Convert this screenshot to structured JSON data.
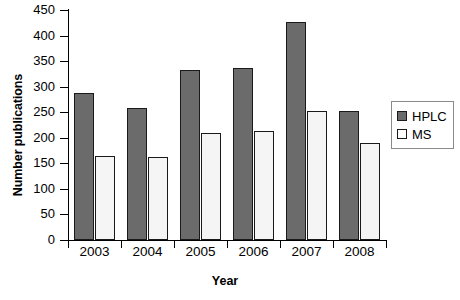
{
  "chart_data": {
    "type": "bar",
    "title": "",
    "xlabel": "Year",
    "ylabel": "Number publications",
    "categories": [
      "2003",
      "2004",
      "2005",
      "2006",
      "2007",
      "2008"
    ],
    "series": [
      {
        "name": "HPLC",
        "color": "#6b6b6b",
        "values": [
          287,
          259,
          332,
          336,
          427,
          253
        ]
      },
      {
        "name": "MS",
        "color": "#ffffff",
        "values": [
          165,
          162,
          210,
          214,
          252,
          190
        ]
      }
    ],
    "ylim": [
      0,
      450
    ],
    "yticks": [
      0,
      50,
      100,
      150,
      200,
      250,
      300,
      350,
      400,
      450
    ],
    "ytick_labels": [
      "0",
      "50",
      "100",
      "150",
      "200",
      "250",
      "300",
      "350",
      "400",
      "450"
    ],
    "grid": false,
    "legend_position": "right"
  },
  "legend": {
    "entries": [
      {
        "label": "HPLC"
      },
      {
        "label": "MS"
      }
    ]
  }
}
